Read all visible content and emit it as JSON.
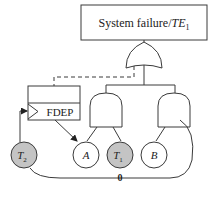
{
  "diagram": {
    "type": "dynamic fault tree",
    "top_event": {
      "label": "System failure/",
      "label_italic": "TE",
      "label_sub": "1"
    },
    "gates": [
      {
        "id": "or-top",
        "type": "OR"
      },
      {
        "id": "and-left",
        "type": "AND"
      },
      {
        "id": "and-right",
        "type": "AND"
      },
      {
        "id": "fdep",
        "type": "FDEP",
        "label": "FDEP"
      }
    ],
    "events": [
      {
        "id": "T2",
        "label": "T",
        "sub": "2",
        "shaded": true
      },
      {
        "id": "A",
        "label": "A",
        "sub": "",
        "shaded": false
      },
      {
        "id": "T1",
        "label": "T",
        "sub": "1",
        "shaded": true
      },
      {
        "id": "B",
        "label": "B",
        "sub": "",
        "shaded": false
      }
    ],
    "edge_labels": {
      "bottom_loop": "0"
    },
    "colors": {
      "stroke": "#3a3a3a",
      "shaded_event": "#c4c4c4",
      "background": "#ffffff"
    }
  }
}
